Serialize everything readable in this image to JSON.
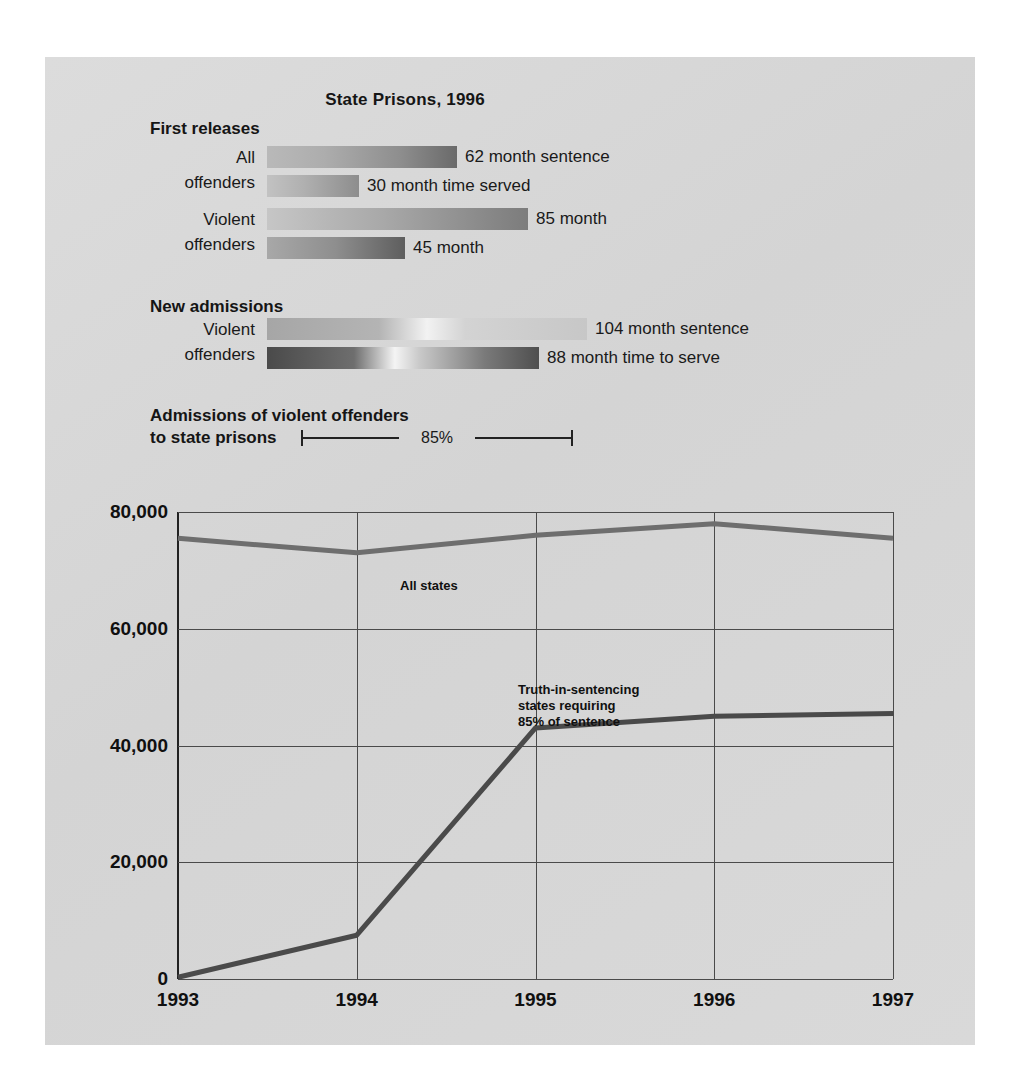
{
  "figure": {
    "title": "State Prisons, 1996",
    "background_color": "#d7d7d7"
  },
  "bar_chart": {
    "groups": [
      {
        "heading": "First releases",
        "rows": [
          {
            "label_line1": "All",
            "label_line2": "offenders",
            "bars": [
              {
                "value": 62,
                "unit": "month",
                "value_label": "62 month sentence",
                "metric": "sentence"
              },
              {
                "value": 30,
                "unit": "month",
                "value_label": "30 month time served",
                "metric": "time served"
              }
            ]
          },
          {
            "label_line1": "Violent",
            "label_line2": "offenders",
            "bars": [
              {
                "value": 85,
                "unit": "month",
                "value_label": "85 month",
                "metric": "sentence"
              },
              {
                "value": 45,
                "unit": "month",
                "value_label": "45 month",
                "metric": "time served"
              }
            ]
          }
        ]
      },
      {
        "heading": "New admissions",
        "rows": [
          {
            "label_line1": "Violent",
            "label_line2": "offenders",
            "bars": [
              {
                "value": 104,
                "unit": "month",
                "value_label": "104 month sentence",
                "metric": "sentence"
              },
              {
                "value": 88,
                "unit": "month",
                "value_label": "88 month time to serve",
                "metric": "time to serve"
              }
            ]
          }
        ]
      }
    ],
    "bracket_label": "85%"
  },
  "chart_data": {
    "type": "line",
    "title": "Admissions of violent offenders to state prisons",
    "title_line1": "Admissions of violent offenders",
    "title_line2": "to state prisons",
    "xlabel": "",
    "ylabel": "",
    "x": [
      1993,
      1994,
      1995,
      1996,
      1997
    ],
    "xticklabels": [
      "1993",
      "1994",
      "1995",
      "1996",
      "1997"
    ],
    "yticks": [
      0,
      20000,
      40000,
      60000,
      80000
    ],
    "yticklabels": [
      "0",
      "20,000",
      "40,000",
      "60,000",
      "80,000"
    ],
    "ylim": [
      0,
      80000
    ],
    "xlim": [
      1993,
      1997
    ],
    "grid": true,
    "legend": "inline-annotations",
    "series": [
      {
        "name": "All states",
        "label": "All states",
        "color": "#6e6e6e",
        "values": [
          75500,
          73000,
          76000,
          78000,
          75500
        ]
      },
      {
        "name": "Truth-in-sentencing states requiring 85% of sentence",
        "label_line1": "Truth-in-sentencing",
        "label_line2": "states requiring",
        "label_line3": "85% of sentence",
        "color": "#4a4a4a",
        "values": [
          300,
          7500,
          43000,
          45000,
          45500
        ]
      }
    ]
  }
}
